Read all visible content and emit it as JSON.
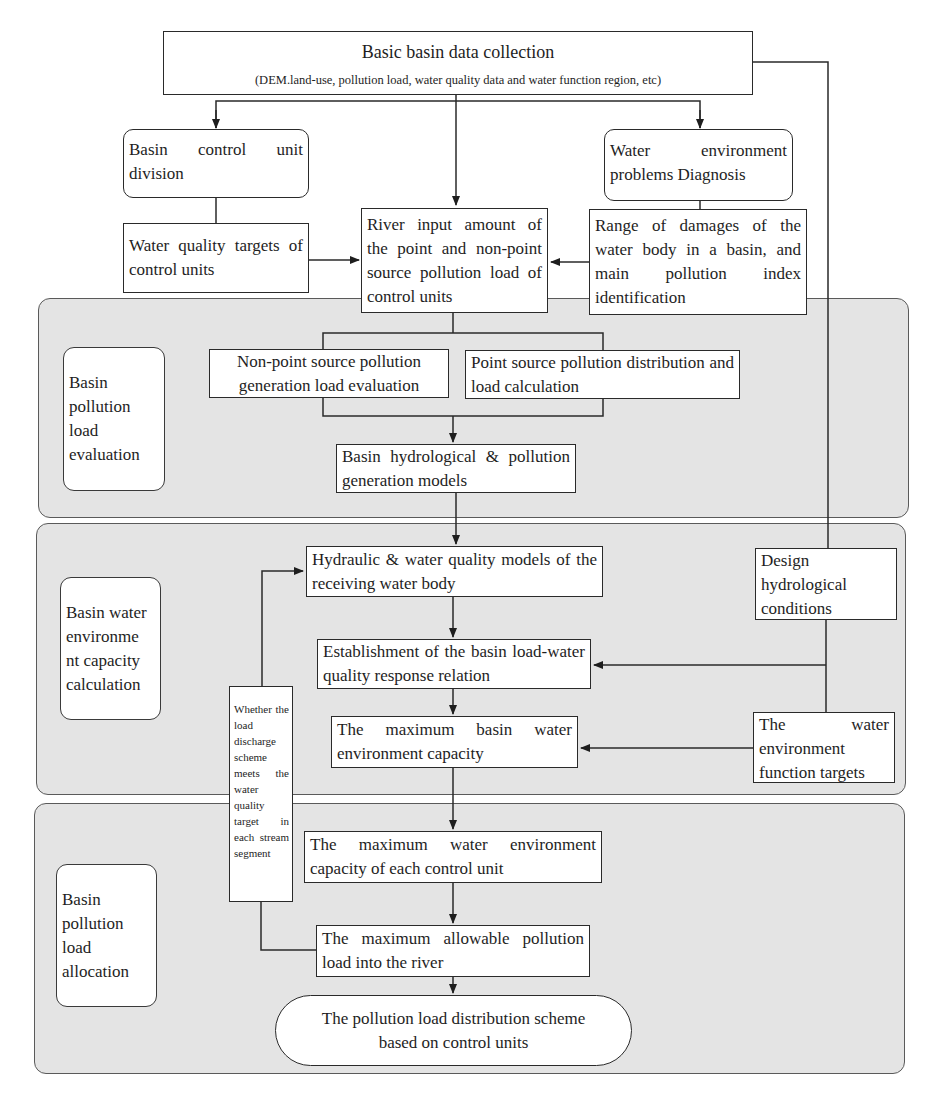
{
  "top": {
    "title": "Basic basin data collection",
    "subtitle": "(DEM.land-use, pollution load, water quality data and water function region, etc)"
  },
  "row1": {
    "control_unit_division": "Basin control unit division",
    "water_env_diagnosis": "Water environment problems Diagnosis"
  },
  "row2": {
    "water_quality_targets": "Water quality targets of control units",
    "river_input": "River input amount of the point and non-point source pollution load of control units",
    "range_damages": "Range of damages of the water body in a basin, and main pollution index identification"
  },
  "panels": {
    "evaluation": {
      "label": "Basin pollution load evaluation",
      "nonpoint": "Non-point source pollution generation load evaluation",
      "point": "Point source pollution distribution and load calculation",
      "hydro_models": "Basin hydrological & pollution generation models"
    },
    "capacity": {
      "label": "Basin water environme nt capacity calculation",
      "hydraulic": "Hydraulic & water quality models of the receiving water body",
      "establishment": "Establishment of the basin load-water quality response relation",
      "max_basin": "The maximum basin water environment capacity",
      "design_hydro": "Design hydrological conditions",
      "function_targets": "The water environment function targets"
    },
    "allocation": {
      "label": "Basin pollution load allocation",
      "max_unit": "The maximum water environment capacity of each control unit",
      "max_allowable": "The maximum allowable pollution load into the river",
      "scheme": "The pollution load distribution scheme based on control units"
    }
  },
  "feedback": {
    "text": "Whether the load discharge scheme meets the water quality target in each stream segment"
  },
  "colors": {
    "panel_fill": "#e4e4e4",
    "line": "#2a2a2a",
    "box_fill": "#ffffff"
  }
}
